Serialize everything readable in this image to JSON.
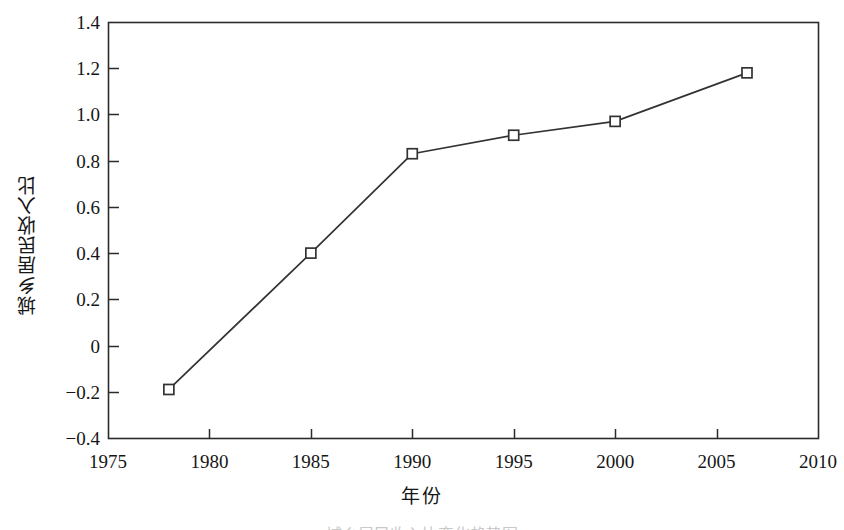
{
  "chart_data": {
    "type": "line",
    "title": "",
    "xlabel": "年份",
    "ylabel": "城乡居民收入比",
    "xlim": [
      1975,
      2010
    ],
    "ylim": [
      -0.4,
      1.4
    ],
    "xticks": [
      "1975",
      "1980",
      "1985",
      "1990",
      "1995",
      "2000",
      "2005",
      "2010"
    ],
    "xtick_values": [
      1975,
      1980,
      1985,
      1990,
      1995,
      2000,
      2005,
      2010
    ],
    "yticks": [
      "1.4",
      "1.2",
      "1.0",
      "0.8",
      "0.6",
      "0.4",
      "0.2",
      "0",
      "-0.2",
      "-0.4"
    ],
    "ytick_values": [
      1.4,
      1.2,
      1.0,
      0.8,
      0.6,
      0.4,
      0.2,
      0,
      -0.2,
      -0.4
    ],
    "grid": false,
    "legend": "none",
    "marker": "open-square",
    "line_color": "#333333",
    "marker_color": "#333333",
    "series": [
      {
        "name": "城乡居民收入比",
        "x": [
          1978,
          1985,
          1990,
          1995,
          2000,
          2006.5
        ],
        "values": [
          -0.19,
          0.4,
          0.83,
          0.91,
          0.97,
          1.18
        ]
      }
    ]
  },
  "caption": {
    "text": "城乡居民收入比变化趋势图"
  }
}
